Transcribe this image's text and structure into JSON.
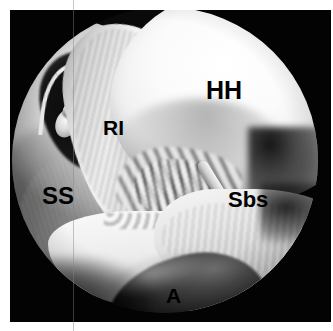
{
  "figure": {
    "kind": "arthroscopic-photograph",
    "view": "circular endoscopic field of view",
    "background_color": "#ffffff",
    "frame_color": "#030303",
    "label_color": "#000000"
  },
  "labels": [
    {
      "id": "hh",
      "text": "HH",
      "name": "humeral-head"
    },
    {
      "id": "ri",
      "text": "RI",
      "name": "rotator-interval"
    },
    {
      "id": "ss",
      "text": "SS",
      "name": "supraspinatus"
    },
    {
      "id": "sbs",
      "text": "Sbs",
      "name": "subscapularis"
    },
    {
      "id": "a",
      "text": "A",
      "name": "axillary-pouch"
    }
  ]
}
